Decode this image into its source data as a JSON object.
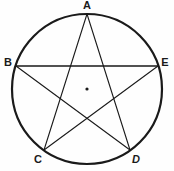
{
  "figure": {
    "type": "geometry-diagram",
    "background_color": "#fefefe",
    "stroke_color": "#1a1a1a",
    "circle": {
      "name": "circumscribed-circle",
      "center_x": 87,
      "center_y": 89,
      "radius": 75,
      "stroke_width": 2.2
    },
    "center_point": {
      "name": "circle-center-dot",
      "x": 87,
      "y": 89,
      "radius": 1.6
    },
    "vertices": [
      {
        "id": "A",
        "label": "A",
        "x": 87,
        "y": 14,
        "label_x": 87,
        "label_y": 6,
        "label_pos": "top"
      },
      {
        "id": "B",
        "label": "B",
        "x": 16,
        "y": 66,
        "label_x": 8,
        "label_y": 63,
        "label_pos": "left"
      },
      {
        "id": "C",
        "label": "C",
        "x": 44,
        "y": 150,
        "label_x": 38,
        "label_y": 160,
        "label_pos": "bottom-left"
      },
      {
        "id": "D",
        "label": "D",
        "x": 130,
        "y": 150,
        "label_x": 136,
        "label_y": 160,
        "label_pos": "bottom-right"
      },
      {
        "id": "E",
        "label": "E",
        "x": 158,
        "y": 66,
        "label_x": 165,
        "label_y": 63,
        "label_pos": "right"
      }
    ],
    "chords": [
      {
        "name": "chord-A-C",
        "from": "A",
        "to": "C",
        "stroke_width": 1.1
      },
      {
        "name": "chord-C-E",
        "from": "C",
        "to": "E",
        "stroke_width": 1.1
      },
      {
        "name": "chord-E-B",
        "from": "E",
        "to": "B",
        "stroke_width": 1.4
      },
      {
        "name": "chord-B-D",
        "from": "B",
        "to": "D",
        "stroke_width": 1.1
      },
      {
        "name": "chord-D-A",
        "from": "D",
        "to": "A",
        "stroke_width": 1.1
      }
    ]
  }
}
